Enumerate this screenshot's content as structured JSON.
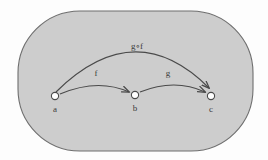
{
  "figure": {
    "name": "function-composition-diagram",
    "caption": "",
    "background_color": "#fdfdfd"
  },
  "region": {
    "shape": "rounded-rectangle",
    "fill_color": "#cdcdcd",
    "stroke_color": "#6e6e6e",
    "x": 18,
    "y": 11,
    "width": 235,
    "height": 140,
    "corner_radius": 62
  },
  "nodes": [
    {
      "id": "a",
      "label": "a",
      "cx": 55,
      "cy": 96,
      "r": 3.6,
      "label_x": 55,
      "label_y": 112,
      "fill_color": "#ffffff",
      "stroke_color": "#4a4a4a"
    },
    {
      "id": "b",
      "label": "b",
      "cx": 135,
      "cy": 95,
      "r": 3.6,
      "label_x": 135,
      "label_y": 111,
      "fill_color": "#ffffff",
      "stroke_color": "#4a4a4a"
    },
    {
      "id": "c",
      "label": "c",
      "cx": 211,
      "cy": 96,
      "r": 3.6,
      "label_x": 211,
      "label_y": 112,
      "fill_color": "#ffffff",
      "stroke_color": "#4a4a4a"
    }
  ],
  "arrows": [
    {
      "id": "f",
      "label": "f",
      "from": "a",
      "to": "b",
      "label_x": 96,
      "label_y": 76,
      "path": "M 60 94 Q 98 78 129 92",
      "stroke_color": "#4a4a4a"
    },
    {
      "id": "g",
      "label": "g",
      "from": "b",
      "to": "c",
      "label_x": 168,
      "label_y": 76,
      "path": "M 140 92 Q 175 78 205 92",
      "stroke_color": "#4a4a4a"
    },
    {
      "id": "gof",
      "label": "g∘f",
      "from": "a",
      "to": "c",
      "label_x": 137,
      "label_y": 49,
      "path": "M 56 92 Q 135 14 209 88",
      "stroke_color": "#4a4a4a"
    }
  ],
  "labels": {
    "node_font_size": "9px",
    "arrow_font_size": "9px"
  }
}
